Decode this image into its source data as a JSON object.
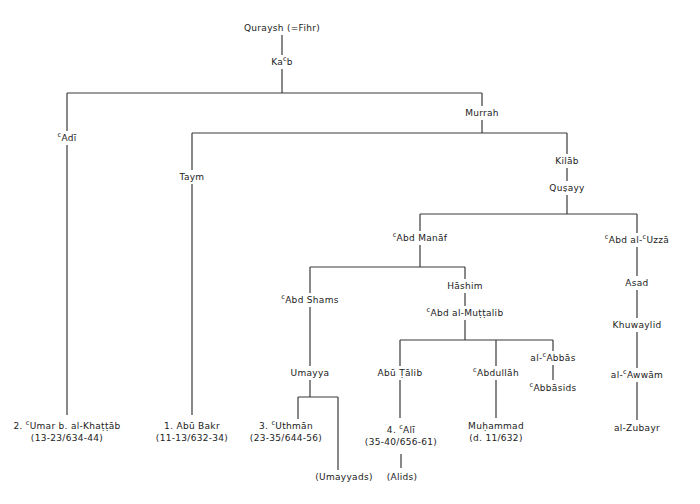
{
  "diagram": {
    "type": "genealogical tree",
    "line_color": "#3a3a3a",
    "nodes": {
      "quraysh": "Quraysh (=Fihr)",
      "kaab": {
        "pre": "Ka",
        "sup": "c",
        "post": "b"
      },
      "adi": {
        "sup": "c",
        "post": "Adī"
      },
      "murrah": "Murrah",
      "taym": "Taym",
      "kilab": "Kilāb",
      "qusayy": "Quṣayy",
      "abd_manaf": {
        "sup": "c",
        "post": "Abd Manāf"
      },
      "abd_al_uzza": {
        "sup": "c",
        "mid": "Abd al-",
        "sup2": "c",
        "post": "Uzzā"
      },
      "abd_shams": {
        "sup": "c",
        "post": "Abd Shams"
      },
      "hashim": "Hāshim",
      "abd_al_muttalib": {
        "sup": "c",
        "post": "Abd al-Muṭṭalib"
      },
      "asad": "Asad",
      "khuwaylid": "Khuwaylid",
      "al_awwam": {
        "pre": "al-",
        "sup": "c",
        "post": "Awwām"
      },
      "al_zubayr": "al-Zubayr",
      "umayya": "Umayya",
      "abu_talib": "Abū Ṭālib",
      "abdullah": {
        "sup": "c",
        "post": "Abdullāh"
      },
      "al_abbas": {
        "pre": "al-",
        "sup": "c",
        "post": "Abbās"
      },
      "abbasids": {
        "sup": "c",
        "post": "Abbāsids"
      },
      "umar": {
        "pre": "2. ",
        "sup": "c",
        "post": "Umar b. al-Khaṭṭāb",
        "line2": "(13-23/634-44)"
      },
      "abu_bakr": {
        "line1": "1. Abū Bakr",
        "line2": "(11-13/632-34)"
      },
      "uthman": {
        "pre": "3. ",
        "sup": "c",
        "post": "Uthmān",
        "line2": "(23-35/644-56)"
      },
      "ali": {
        "pre": "4. ",
        "sup": "c",
        "post": "Alī",
        "line2": "(35-40/656-61)"
      },
      "muhammad": {
        "line1": "Muḥammad",
        "line2": "(d. 11/632)"
      },
      "umayyads": "(Umayyads)",
      "alids": "(Alids)"
    }
  }
}
